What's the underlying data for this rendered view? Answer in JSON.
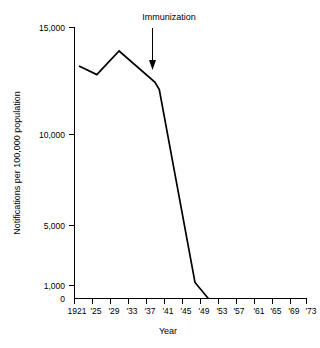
{
  "chart_data": {
    "type": "line",
    "title": "",
    "xlabel": "Year",
    "ylabel": "Notifications per 100,000 population",
    "grid": false,
    "legend": "none",
    "x_tick_labels": [
      "1921",
      "'25",
      "'29",
      "'33",
      "'37",
      "'41",
      "'45",
      "'49",
      "'53",
      "'57",
      "'61",
      "'65",
      "'69",
      "'73"
    ],
    "x_tick_years": [
      1921,
      1925,
      1929,
      1933,
      1937,
      1941,
      1945,
      1949,
      1953,
      1957,
      1961,
      1965,
      1969,
      1973
    ],
    "xlim": [
      1921,
      1973
    ],
    "y_tick_labels": [
      "15,000",
      "10,000",
      "5,000",
      "1,000",
      "0"
    ],
    "y_tick_values": [
      15000,
      10000,
      5000,
      1000,
      0
    ],
    "ylim": [
      0,
      15000
    ],
    "y_axis_note": "non-linear break between 0 and 1,000",
    "series": [
      {
        "name": "Notifications",
        "x": [
          1922,
          1926,
          1931,
          1939,
          1940,
          1948,
          1951
        ],
        "values": [
          13200,
          12800,
          13900,
          12450,
          12100,
          1200,
          0
        ]
      }
    ],
    "annotations": [
      {
        "label": "Immunization",
        "icon": "down-arrow",
        "x_year": 1940,
        "points_to_value": 12200
      }
    ]
  },
  "axis": {
    "x_title": "Year",
    "y_title": "Notifications per 100,000 population"
  }
}
